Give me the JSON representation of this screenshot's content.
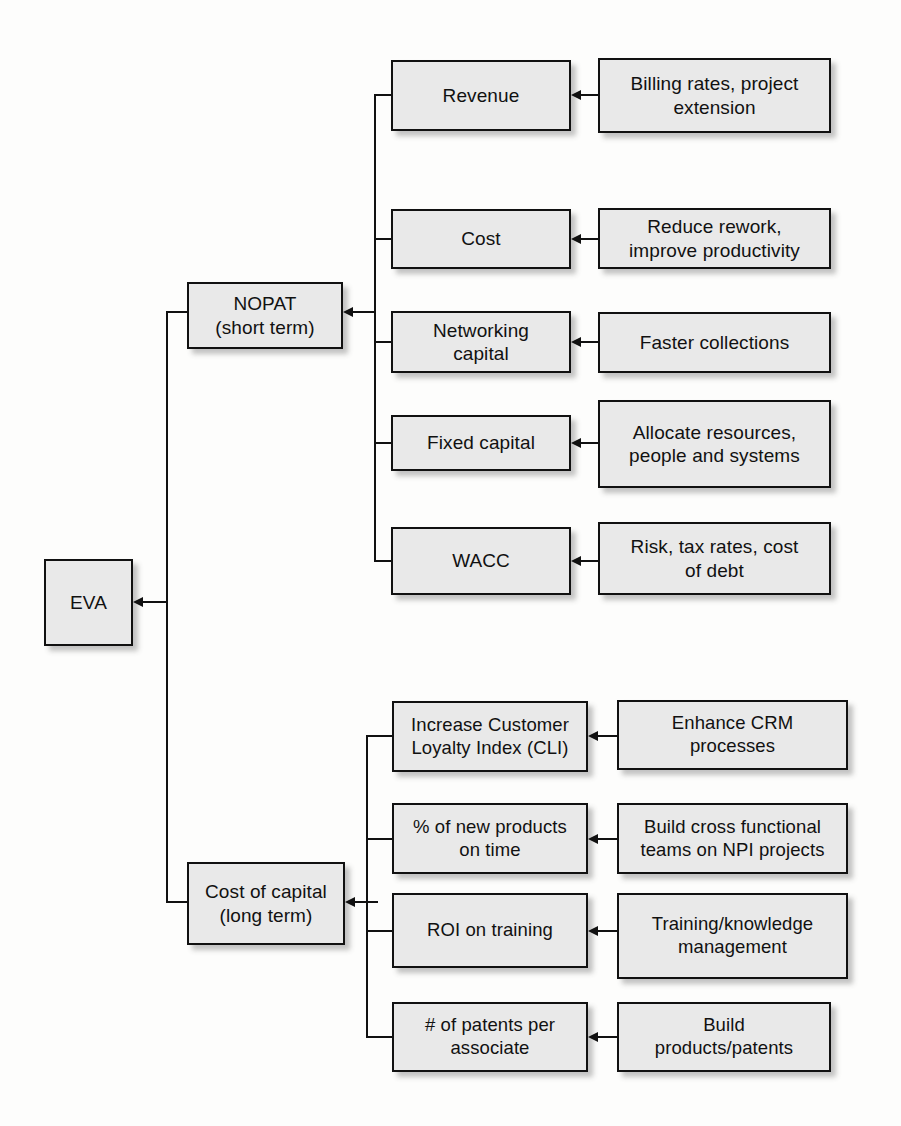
{
  "diagram": {
    "root": {
      "label": "EVA"
    },
    "branches": [
      {
        "id": "nopat",
        "label": "NOPAT\n(short term)",
        "drivers": [
          {
            "label": "Revenue",
            "initiative": "Billing rates, project\nextension"
          },
          {
            "label": "Cost",
            "initiative": "Reduce rework,\nimprove productivity"
          },
          {
            "label": "Networking\ncapital",
            "initiative": "Faster collections"
          },
          {
            "label": "Fixed capital",
            "initiative": "Allocate resources,\npeople and systems"
          },
          {
            "label": "WACC",
            "initiative": "Risk, tax rates, cost\nof debt"
          }
        ]
      },
      {
        "id": "cost-of-capital",
        "label": "Cost of capital\n(long term)",
        "drivers": [
          {
            "label": "Increase Customer\nLoyalty Index (CLI)",
            "initiative": "Enhance CRM\nprocesses"
          },
          {
            "label": "% of new products\non time",
            "initiative": "Build cross functional\nteams on NPI projects"
          },
          {
            "label": "ROI on training",
            "initiative": "Training/knowledge\nmanagement"
          },
          {
            "label": "# of patents per\nassociate",
            "initiative": "Build\nproducts/patents"
          }
        ]
      }
    ],
    "style": {
      "box_fill": "#e9e9e9",
      "box_border": "#111111",
      "page_background": "#fdfdfc",
      "connector_color": "#111111"
    }
  }
}
